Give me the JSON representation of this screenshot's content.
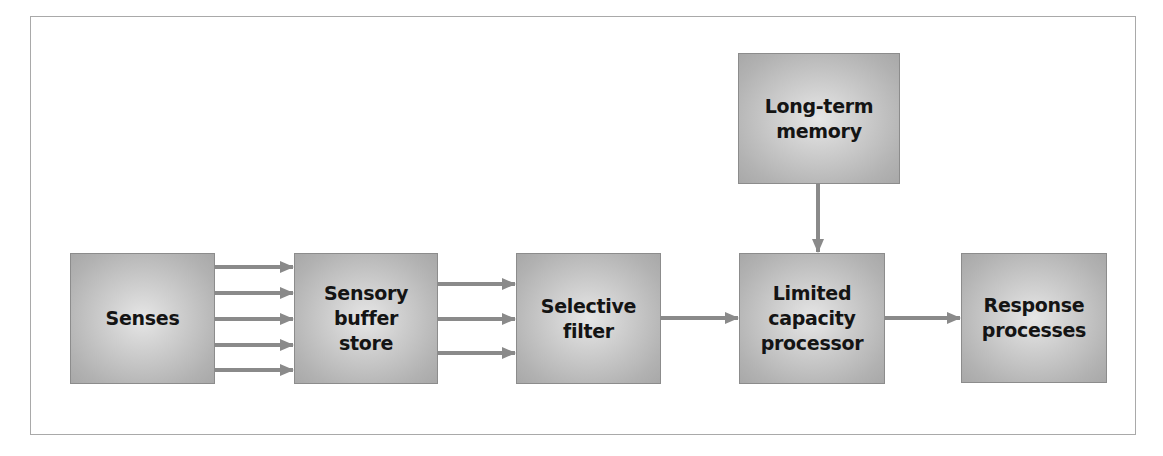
{
  "diagram": {
    "type": "flowchart",
    "title": "",
    "colors": {
      "frame_border": "#a9a9a9",
      "box_border": "#8c8c8c",
      "box_fill_center": "#e6e6e6",
      "box_fill_edge": "#a8a8a8",
      "arrow": "#8a8a8a",
      "text": "#141414"
    },
    "nodes": [
      {
        "id": "senses",
        "label": "Senses"
      },
      {
        "id": "sensory_buffer",
        "label": "Sensory\nbuffer\nstore"
      },
      {
        "id": "selective_filter",
        "label": "Selective\nfilter"
      },
      {
        "id": "long_term_memory",
        "label": "Long-term\nmemory"
      },
      {
        "id": "limited_capacity",
        "label": "Limited\ncapacity\nprocessor"
      },
      {
        "id": "response",
        "label": "Response\nprocesses"
      }
    ],
    "edges": [
      {
        "from": "senses",
        "to": "sensory_buffer",
        "count": 5
      },
      {
        "from": "sensory_buffer",
        "to": "selective_filter",
        "count": 3
      },
      {
        "from": "selective_filter",
        "to": "limited_capacity",
        "count": 1
      },
      {
        "from": "long_term_memory",
        "to": "limited_capacity",
        "count": 1
      },
      {
        "from": "limited_capacity",
        "to": "response",
        "count": 1
      }
    ]
  }
}
